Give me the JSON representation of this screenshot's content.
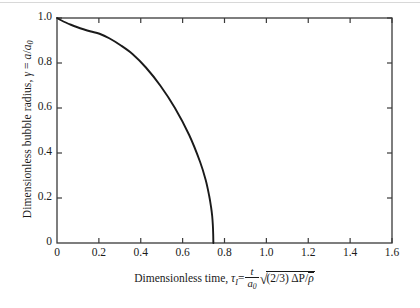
{
  "figure": {
    "background_color": "#ffffff",
    "line_color": "#1a1a1a",
    "axis_color": "#3a3a3a"
  },
  "axes": {
    "x": {
      "title_parts": {
        "lead": "Dimensionless time,",
        "symbol": "τ",
        "symbol_sub": "I",
        "equals": "=",
        "frac_num": "t",
        "frac_den": "a",
        "frac_den_sub": "0",
        "radical": "√",
        "radicand_lead": "(2/3) ΔP/",
        "radicand_tail": "ρ"
      },
      "ticks": [
        "0",
        "0.2",
        "0.4",
        "0.6",
        "0.8",
        "1.0",
        "1.2",
        "1.4",
        "1.6"
      ],
      "tick_values": [
        0,
        0.2,
        0.4,
        0.6,
        0.8,
        1.0,
        1.2,
        1.4,
        1.6
      ],
      "range": [
        0,
        1.6
      ]
    },
    "y": {
      "title_parts": {
        "lead": "Dimensionless bubble radius,",
        "symbol": "γ",
        "equals": "=",
        "num": "a",
        "den": "a",
        "den_sub": "0"
      },
      "ticks": [
        "0",
        "0.2",
        "0.4",
        "0.6",
        "0.8",
        "1.0"
      ],
      "tick_values": [
        0,
        0.2,
        0.4,
        0.6,
        0.8,
        1.0
      ],
      "range": [
        0,
        1.0
      ]
    }
  },
  "chart_data": {
    "type": "line",
    "title": "",
    "xlabel": "Dimensionless time, τ_I = (t/a₀)√((2/3)ΔP/ρ̄)",
    "ylabel": "Dimensionless bubble radius, γ = a/a₀",
    "xlim": [
      0,
      1.6
    ],
    "ylim": [
      0,
      1.0
    ],
    "grid": false,
    "legend": null,
    "series": [
      {
        "name": "Rayleigh bubble collapse",
        "x": [
          0.0,
          0.0196,
          0.0417,
          0.0665,
          0.0945,
          0.1262,
          0.1622,
          0.203,
          0.2494,
          0.3018,
          0.3604,
          0.4246,
          0.4931,
          0.5633,
          0.6313,
          0.6836,
          0.7102,
          0.7268,
          0.7358,
          0.7412,
          0.7443,
          0.746,
          0.7468
        ],
        "y": [
          1.0,
          0.99,
          0.98,
          0.97,
          0.96,
          0.95,
          0.94,
          0.93,
          0.91,
          0.88,
          0.84,
          0.78,
          0.7,
          0.6,
          0.48,
          0.36,
          0.28,
          0.21,
          0.16,
          0.12,
          0.08,
          0.04,
          0.0
        ]
      }
    ],
    "annotations": [
      {
        "text": "curve reaches γ = 0 at τ ≈ 0.75",
        "visible": false
      }
    ]
  },
  "plot_geometry": {
    "left": 57,
    "top": 18,
    "right": 392,
    "bottom": 243
  }
}
